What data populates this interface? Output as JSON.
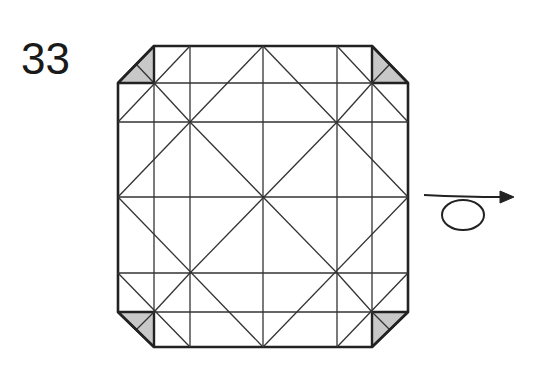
{
  "step": {
    "number": "33"
  },
  "colors": {
    "line": "#222222",
    "fill_shaded": "#c8c8c8",
    "background": "#ffffff"
  },
  "diagram": {
    "type": "origami-crease-pattern",
    "square": {
      "left": 118,
      "top": 46,
      "right": 408,
      "bottom": 347
    },
    "grid_x": [
      118,
      190,
      263,
      337,
      408
    ],
    "grid_y": [
      46,
      122,
      197,
      273,
      347
    ],
    "corner_folds": [
      "top-left",
      "top-right",
      "bottom-left",
      "bottom-right"
    ],
    "symbol": {
      "name": "turn-over-arrow",
      "meaning": "turn the model over"
    }
  }
}
